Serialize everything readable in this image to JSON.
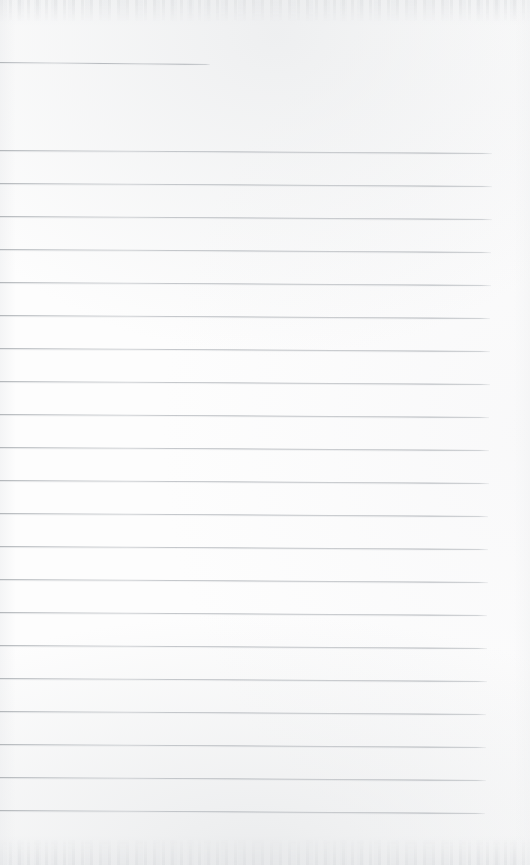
{
  "document": {
    "kind": "scanned-ruled-notebook-page",
    "title": "Blank lined notebook page",
    "page_width": 530,
    "page_height": 865,
    "has_handwriting": false,
    "has_printed_text": false,
    "visible_text": "",
    "colors": {
      "paper": "#fdfdfd",
      "rule": "#b5b9bd",
      "rule_ghost": "#d4d6d9",
      "scan_edge_shadow": "#e7e8ea"
    },
    "ruling": {
      "total_rules": 21,
      "full_width_rules": 20,
      "short_rules": 1,
      "line_spacing_px": 33,
      "first_full_rule_y": 150,
      "last_full_rule_y": 810,
      "left_start_x": 0,
      "right_end_x": 490,
      "slant_px_over_full_width": 3,
      "stroke_width_px": 1
    },
    "rules": [
      {
        "index": 0,
        "x": 0,
        "y": 62,
        "width": 210,
        "slant": 2,
        "variant": "short"
      },
      {
        "index": 1,
        "x": 0,
        "y": 150,
        "width": 492,
        "slant": 3,
        "variant": "full"
      },
      {
        "index": 2,
        "x": 0,
        "y": 183,
        "width": 492,
        "slant": 3,
        "variant": "full"
      },
      {
        "index": 3,
        "x": 0,
        "y": 216,
        "width": 492,
        "slant": 3,
        "variant": "full"
      },
      {
        "index": 4,
        "x": 0,
        "y": 249,
        "width": 491,
        "slant": 3,
        "variant": "full"
      },
      {
        "index": 5,
        "x": 0,
        "y": 282,
        "width": 491,
        "slant": 3,
        "variant": "full"
      },
      {
        "index": 6,
        "x": 0,
        "y": 315,
        "width": 490,
        "slant": 3,
        "variant": "full"
      },
      {
        "index": 7,
        "x": 0,
        "y": 348,
        "width": 490,
        "slant": 3,
        "variant": "full"
      },
      {
        "index": 8,
        "x": 0,
        "y": 381,
        "width": 490,
        "slant": 3,
        "variant": "full"
      },
      {
        "index": 9,
        "x": 0,
        "y": 414,
        "width": 489,
        "slant": 3,
        "variant": "full"
      },
      {
        "index": 10,
        "x": 0,
        "y": 447,
        "width": 489,
        "slant": 3,
        "variant": "full"
      },
      {
        "index": 11,
        "x": 0,
        "y": 480,
        "width": 489,
        "slant": 3,
        "variant": "full"
      },
      {
        "index": 12,
        "x": 0,
        "y": 513,
        "width": 488,
        "slant": 3,
        "variant": "full"
      },
      {
        "index": 13,
        "x": 0,
        "y": 546,
        "width": 488,
        "slant": 3,
        "variant": "full"
      },
      {
        "index": 14,
        "x": 0,
        "y": 579,
        "width": 488,
        "slant": 3,
        "variant": "full"
      },
      {
        "index": 15,
        "x": 0,
        "y": 612,
        "width": 487,
        "slant": 3,
        "variant": "full"
      },
      {
        "index": 16,
        "x": 0,
        "y": 645,
        "width": 487,
        "slant": 3,
        "variant": "full"
      },
      {
        "index": 17,
        "x": 0,
        "y": 678,
        "width": 487,
        "slant": 3,
        "variant": "full"
      },
      {
        "index": 18,
        "x": 0,
        "y": 711,
        "width": 486,
        "slant": 3,
        "variant": "full"
      },
      {
        "index": 19,
        "x": 0,
        "y": 744,
        "width": 486,
        "slant": 3,
        "variant": "full"
      },
      {
        "index": 20,
        "x": 0,
        "y": 777,
        "width": 486,
        "slant": 3,
        "variant": "full"
      },
      {
        "index": 21,
        "x": 0,
        "y": 810,
        "width": 485,
        "slant": 3,
        "variant": "full"
      }
    ]
  }
}
